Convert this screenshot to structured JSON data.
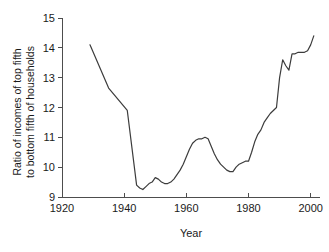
{
  "chart_data": {
    "type": "line",
    "title": "",
    "xlabel": "Year",
    "ylabel_line1": "Ratio of incomes of top fifth",
    "ylabel_line2": "to bottom fifth of households",
    "xlim": [
      1920,
      2003
    ],
    "ylim": [
      9,
      15
    ],
    "xticks": [
      1920,
      1940,
      1960,
      1980,
      2000
    ],
    "yticks": [
      9,
      10,
      11,
      12,
      13,
      14,
      15
    ],
    "xtick_labels": [
      "1920",
      "1940",
      "1960",
      "1980",
      "2000"
    ],
    "ytick_labels": [
      "9",
      "10",
      "11",
      "12",
      "13",
      "14",
      "15"
    ],
    "grid": false,
    "legend": "none",
    "line_color": "#3c3c3c",
    "axis_color": "#4d4d4d",
    "series": [
      {
        "name": "Ratio of incomes of top fifth to bottom fifth of households",
        "x": [
          1929,
          1935,
          1941,
          1944,
          1945,
          1946,
          1947,
          1948,
          1949,
          1950,
          1951,
          1952,
          1953,
          1954,
          1955,
          1956,
          1957,
          1958,
          1959,
          1960,
          1961,
          1962,
          1963,
          1964,
          1965,
          1966,
          1967,
          1968,
          1969,
          1970,
          1971,
          1972,
          1973,
          1974,
          1975,
          1976,
          1977,
          1978,
          1979,
          1980,
          1981,
          1982,
          1983,
          1984,
          1985,
          1986,
          1987,
          1988,
          1989,
          1990,
          1991,
          1992,
          1993,
          1994,
          1995,
          1996,
          1997,
          1998,
          1999,
          2000,
          2001
        ],
        "y": [
          14.1,
          12.65,
          11.9,
          9.4,
          9.3,
          9.25,
          9.35,
          9.45,
          9.5,
          9.65,
          9.6,
          9.5,
          9.45,
          9.45,
          9.5,
          9.6,
          9.75,
          9.9,
          10.1,
          10.35,
          10.6,
          10.8,
          10.9,
          10.95,
          10.95,
          11.0,
          10.95,
          10.7,
          10.45,
          10.25,
          10.1,
          10.0,
          9.9,
          9.85,
          9.85,
          10.0,
          10.1,
          10.15,
          10.2,
          10.2,
          10.5,
          10.85,
          11.1,
          11.25,
          11.5,
          11.65,
          11.8,
          11.9,
          12.0,
          13.0,
          13.6,
          13.4,
          13.25,
          13.8,
          13.8,
          13.85,
          13.85,
          13.85,
          13.9,
          14.1,
          14.4
        ]
      }
    ]
  },
  "geometry": {
    "plot_left": 62,
    "plot_right": 320,
    "plot_top": 18,
    "plot_bottom": 197
  }
}
